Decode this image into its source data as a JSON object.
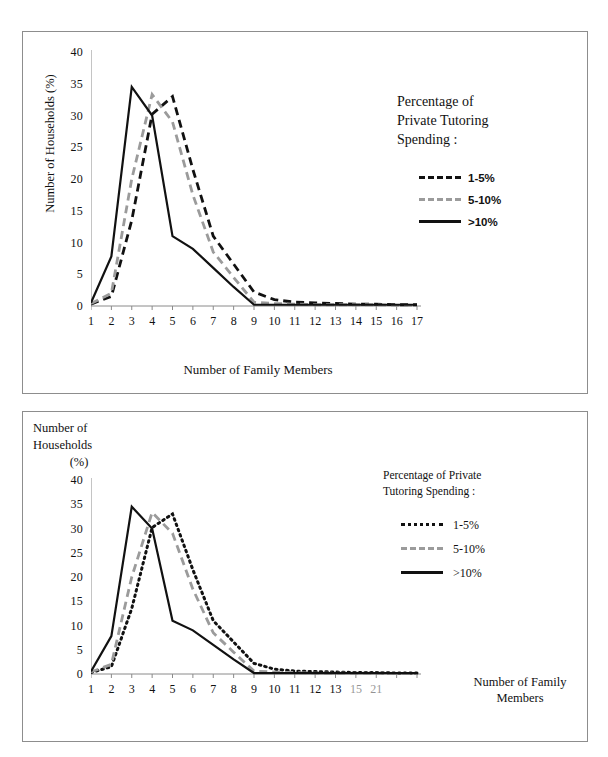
{
  "figure": {
    "panels": [
      "top-chart",
      "bottom-chart"
    ]
  },
  "top_chart": {
    "ylabel": "Number of Households (%)",
    "xlabel": "Number of Family Members",
    "legend_title": "Percentage of Private Tutoring Spending :",
    "legend_title_lines": [
      "Percentage of",
      "Private Tutoring",
      "Spending :"
    ],
    "series_labels": [
      "1-5%",
      "5-10%",
      ">10%"
    ]
  },
  "bottom_chart": {
    "ylabel_lines": [
      "Number of",
      "Households",
      "(%)"
    ],
    "xlabel_lines": [
      "Number of Family",
      "Members"
    ],
    "legend_title_lines": [
      "Percentage of Private",
      "Tutoring Spending :"
    ],
    "series_labels": [
      "1-5%",
      "5-10%",
      ">10%"
    ]
  },
  "chart_data": [
    {
      "id": "top-chart",
      "type": "line",
      "title": "",
      "xlabel": "Number of Family Members",
      "ylabel": "Number of Households (%)",
      "x": [
        1,
        2,
        3,
        4,
        5,
        6,
        7,
        8,
        9,
        10,
        11,
        12,
        13,
        14,
        15,
        16,
        17
      ],
      "xticks": [
        "1",
        "2",
        "3",
        "4",
        "5",
        "6",
        "7",
        "8",
        "9",
        "10",
        "11",
        "12",
        "13",
        "14",
        "15",
        "16",
        "17"
      ],
      "yticks": [
        0,
        5,
        10,
        15,
        20,
        25,
        30,
        35,
        40
      ],
      "xlim": [
        1,
        17
      ],
      "ylim": [
        0,
        40
      ],
      "grid": false,
      "legend_position": "right",
      "legend_title": "Percentage of Private Tutoring Spending :",
      "series": [
        {
          "name": "1-5%",
          "style": "dashed",
          "color": "#111111",
          "values": [
            0.3,
            1.5,
            13.5,
            30.2,
            33.0,
            21.5,
            11.0,
            6.6,
            2.2,
            1.0,
            0.6,
            0.5,
            0.4,
            0.3,
            0.3,
            0.2,
            0.2
          ]
        },
        {
          "name": "5-10%",
          "style": "dashed",
          "color": "#9b9b9b",
          "values": [
            0.4,
            2.0,
            20.0,
            33.3,
            29.0,
            17.5,
            8.5,
            4.5,
            0.6,
            0.4,
            0.3,
            0.2,
            0.2,
            0.2,
            0.2,
            0.1,
            0.1
          ]
        },
        {
          "name": ">10%",
          "style": "solid",
          "color": "#111111",
          "values": [
            0.5,
            7.8,
            34.5,
            30.0,
            11.0,
            9.0,
            6.0,
            3.0,
            0.2,
            0.2,
            0.2,
            0.2,
            0.2,
            0.2,
            0.2,
            0.2,
            0.2
          ]
        }
      ]
    },
    {
      "id": "bottom-chart",
      "type": "line",
      "title": "",
      "xlabel": "Number of Family Members",
      "ylabel": "Number of Households (%)",
      "x": [
        1,
        2,
        3,
        4,
        5,
        6,
        7,
        8,
        9,
        10,
        11,
        12,
        13,
        14,
        15,
        16,
        17
      ],
      "xticks": [
        "1",
        "2",
        "3",
        "4",
        "5",
        "6",
        "7",
        "8",
        "9",
        "10",
        "11",
        "12",
        "13",
        "15",
        "21"
      ],
      "yticks": [
        0,
        5,
        10,
        15,
        20,
        25,
        30,
        35,
        40
      ],
      "xlim": [
        1,
        17
      ],
      "ylim": [
        0,
        40
      ],
      "grid": false,
      "legend_position": "right",
      "legend_title": "Percentage of Private Tutoring Spending :",
      "series": [
        {
          "name": "1-5%",
          "style": "dotted",
          "color": "#111111",
          "values": [
            0.3,
            1.5,
            13.5,
            30.2,
            33.0,
            21.5,
            11.0,
            6.6,
            2.2,
            1.0,
            0.6,
            0.5,
            0.4,
            0.3,
            0.3,
            0.2,
            0.2
          ]
        },
        {
          "name": "5-10%",
          "style": "dashed",
          "color": "#9b9b9b",
          "values": [
            0.4,
            2.0,
            20.0,
            33.3,
            29.0,
            17.5,
            8.5,
            4.5,
            0.6,
            0.4,
            0.3,
            0.2,
            0.2,
            0.2,
            0.2,
            0.1,
            0.1
          ]
        },
        {
          "name": ">10%",
          "style": "solid",
          "color": "#111111",
          "values": [
            0.5,
            7.8,
            34.5,
            30.0,
            11.0,
            9.0,
            6.0,
            3.0,
            0.2,
            0.2,
            0.2,
            0.2,
            0.2,
            0.2,
            0.2,
            0.2,
            0.2
          ]
        }
      ]
    }
  ]
}
